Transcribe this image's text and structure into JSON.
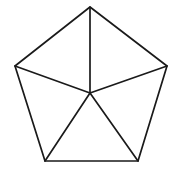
{
  "figure": {
    "name": "pentagon-with-center-spokes",
    "shape_label": "pentagon",
    "background_color": "#ffffff",
    "stroke_color": "#1a1a1a",
    "stroke_width": 1.7,
    "canvas": {
      "width": 177,
      "height": 172
    },
    "vertices": [
      {
        "id": "apex",
        "label": "top",
        "x": 90,
        "y": 7
      },
      {
        "id": "right",
        "label": "upper-right",
        "x": 167,
        "y": 66
      },
      {
        "id": "bottom-right",
        "label": "lower-right",
        "x": 138,
        "y": 161
      },
      {
        "id": "bottom-left",
        "label": "lower-left",
        "x": 45,
        "y": 161
      },
      {
        "id": "left",
        "label": "upper-left",
        "x": 15,
        "y": 66
      }
    ],
    "center": {
      "id": "center",
      "label": "center",
      "x": 90,
      "y": 93
    },
    "outline_path": "M 90 7 L 167 66 L 138 161 L 45 161 L 15 66 Z",
    "spokes": [
      {
        "id": "spoke-apex",
        "from": "center",
        "to": "apex",
        "path": "M 90 93 L 90 7"
      },
      {
        "id": "spoke-right",
        "from": "center",
        "to": "right",
        "path": "M 90 93 L 167 66"
      },
      {
        "id": "spoke-bottom-right",
        "from": "center",
        "to": "bottom-right",
        "path": "M 90 93 L 138 161"
      },
      {
        "id": "spoke-bottom-left",
        "from": "center",
        "to": "bottom-left",
        "path": "M 90 93 L 45 161"
      },
      {
        "id": "spoke-left",
        "from": "center",
        "to": "left",
        "path": "M 90 93 L 15 66"
      }
    ],
    "triangle_count": 5
  }
}
